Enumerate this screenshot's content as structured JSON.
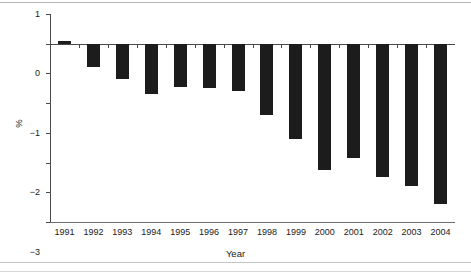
{
  "chart_data": {
    "type": "bar",
    "title": "",
    "xlabel": "Year",
    "ylabel": "%",
    "categories": [
      "1991",
      "1992",
      "1993",
      "1994",
      "1995",
      "1996",
      "1997",
      "1998",
      "1999",
      "2000",
      "2001",
      "2002",
      "2003",
      "2004"
    ],
    "values": [
      0.1,
      -0.8,
      -1.2,
      -1.7,
      -1.45,
      -1.5,
      -1.6,
      -2.4,
      -3.2,
      -4.25,
      -3.85,
      -4.5,
      -4.8,
      -5.4
    ],
    "ylim": [
      -6,
      1
    ],
    "yticks": [
      1,
      0,
      -1,
      -2,
      -3,
      -4,
      -5,
      -6
    ],
    "ytick_labels": [
      "1",
      "0",
      "−1",
      "−2",
      "−3",
      "−4",
      "−5",
      "−6"
    ],
    "grid": false,
    "legend": "none",
    "bar_color": "#1c1c1c",
    "axis_color": "#4a4a4a"
  },
  "axes": {
    "y_title": "%",
    "x_title": "Year"
  }
}
